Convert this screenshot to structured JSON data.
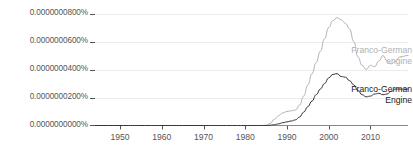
{
  "chart_data": {
    "type": "line",
    "title": "",
    "xlabel": "",
    "ylabel": "",
    "xlim": [
      1944,
      2019
    ],
    "ylim": [
      0.0,
      9e-10
    ],
    "grid": true,
    "legend_position": "right-inline",
    "x_tick_labels": [
      "1950",
      "1960",
      "1970",
      "1980",
      "1990",
      "2000",
      "2010"
    ],
    "x_ticks": [
      1950,
      1960,
      1970,
      1980,
      1990,
      2000,
      2010
    ],
    "y_tick_labels": [
      "0.0000000000%",
      "0.0000000200%",
      "0.0000000400%",
      "0.0000000600%",
      "0.0000000800%"
    ],
    "y_ticks": [
      0,
      2e-10,
      4e-10,
      6e-10,
      8e-10
    ],
    "series": [
      {
        "name": "Franco-German engine",
        "color": "#b4b4b4",
        "label_lines": [
          "Franco-German",
          "engine"
        ],
        "x": [
          1944,
          1950,
          1955,
          1960,
          1965,
          1970,
          1974,
          1977,
          1980,
          1982,
          1984,
          1985,
          1986,
          1987,
          1988,
          1989,
          1990,
          1991,
          1992,
          1993,
          1994,
          1995,
          1996,
          1997,
          1998,
          1999,
          2000,
          2001,
          2002,
          2003,
          2004,
          2005,
          2006,
          2007,
          2008,
          2009,
          2010,
          2011,
          2012,
          2013,
          2014,
          2015,
          2016,
          2017,
          2019
        ],
        "values": [
          0.0,
          0.0,
          0.0,
          0.0,
          0.0,
          0.0,
          0.0,
          0.0,
          0.0,
          0.0,
          0.0,
          2e-12,
          1.5e-11,
          4.5e-11,
          7e-11,
          9e-11,
          1e-10,
          1.05e-10,
          1.1e-10,
          1.45e-10,
          2.1e-10,
          2.9e-10,
          3.7e-10,
          4.5e-10,
          5.3e-10,
          6.2e-10,
          7e-10,
          7.5e-10,
          7.7e-10,
          7.55e-10,
          7.3e-10,
          6.9e-10,
          6e-10,
          4.9e-10,
          4.3e-10,
          4e-10,
          4.3e-10,
          4.2e-10,
          4.6e-10,
          5e-10,
          4.6e-10,
          4.4e-10,
          4.6e-10,
          4.9e-10,
          5e-10
        ]
      },
      {
        "name": "Franco-German Engine",
        "color": "#333333",
        "label_lines": [
          "Franco-German",
          "Engine"
        ],
        "x": [
          1944,
          1950,
          1955,
          1960,
          1965,
          1970,
          1974,
          1977,
          1980,
          1982,
          1984,
          1985,
          1986,
          1987,
          1988,
          1989,
          1990,
          1991,
          1992,
          1993,
          1994,
          1995,
          1996,
          1997,
          1998,
          1999,
          2000,
          2001,
          2002,
          2003,
          2004,
          2005,
          2006,
          2007,
          2008,
          2009,
          2010,
          2011,
          2012,
          2013,
          2014,
          2015,
          2016,
          2017,
          2019
        ],
        "values": [
          0.0,
          0.0,
          0.0,
          0.0,
          0.0,
          0.0,
          0.0,
          0.0,
          0.0,
          0.0,
          0.0,
          0.0,
          2e-12,
          6e-12,
          1.2e-11,
          2e-11,
          2.6e-11,
          3.2e-11,
          4e-11,
          6e-11,
          9.5e-11,
          1.35e-10,
          1.75e-10,
          2.2e-10,
          2.6e-10,
          3e-10,
          3.4e-10,
          3.65e-10,
          3.7e-10,
          3.5e-10,
          3.45e-10,
          3.2e-10,
          2.9e-10,
          2.5e-10,
          2.2e-10,
          2.05e-10,
          2.1e-10,
          2.25e-10,
          2.3e-10,
          2.2e-10,
          2.25e-10,
          2.45e-10,
          2.6e-10,
          2.6e-10,
          2.6e-10
        ]
      }
    ]
  },
  "axes": {
    "axis_line_color": "#888888",
    "grid_color": "#ebebeb",
    "tick_text_color": "#555555"
  }
}
